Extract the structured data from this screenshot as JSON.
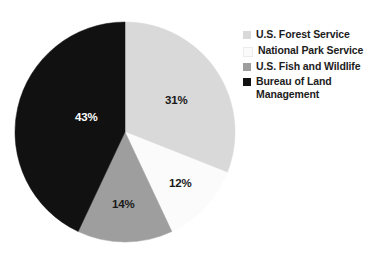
{
  "chart_data": {
    "type": "pie",
    "title": "",
    "subtitle": "",
    "xlabel": "",
    "ylabel": "",
    "grid": false,
    "legend_position": "right",
    "start_angle_deg": 0,
    "direction": "clockwise",
    "categories": [
      "U.S. Forest Service",
      "National Park Service",
      "U.S. Fish and Wildlife",
      "Bureau of Land Management"
    ],
    "values": [
      31,
      12,
      14,
      43
    ],
    "value_unit": "%",
    "data_labels": [
      "31%",
      "12%",
      "14%",
      "43%"
    ],
    "colors": [
      "#d9d9d9",
      "#fbfbfb",
      "#9e9e9e",
      "#111111"
    ],
    "label_text_colors": [
      "#1a1a1a",
      "#1a1a1a",
      "#1a1a1a",
      "#ffffff"
    ],
    "slices": [
      {
        "label": "U.S. Forest Service",
        "value": 31,
        "data_label": "31%",
        "color": "#d9d9d9",
        "label_color": "#1a1a1a",
        "start_deg": 0,
        "end_deg": 111.6,
        "label_x": 151,
        "label_y": 83
      },
      {
        "label": "National Park Service",
        "value": 12,
        "data_label": "12%",
        "color": "#fbfbfb",
        "label_color": "#1a1a1a",
        "start_deg": 111.6,
        "end_deg": 154.8,
        "label_x": 155,
        "label_y": 166
      },
      {
        "label": "U.S. Fish and Wildlife",
        "value": 14,
        "data_label": "14%",
        "color": "#9e9e9e",
        "label_color": "#1a1a1a",
        "start_deg": 154.8,
        "end_deg": 205.2,
        "label_x": 98,
        "label_y": 187
      },
      {
        "label": "Bureau of Land Management",
        "value": 43,
        "data_label": "43%",
        "color": "#111111",
        "label_color": "#ffffff",
        "start_deg": 205.2,
        "end_deg": 360,
        "label_x": 61,
        "label_y": 100
      }
    ]
  },
  "legend": {
    "items": [
      {
        "label": "U.S. Forest Service",
        "color": "#d9d9d9"
      },
      {
        "label": "National Park Service",
        "color": "#fbfbfb"
      },
      {
        "label": "U.S. Fish and Wildlife",
        "color": "#9e9e9e"
      },
      {
        "label": "Bureau of Land\nManagement",
        "color": "#111111"
      }
    ]
  }
}
